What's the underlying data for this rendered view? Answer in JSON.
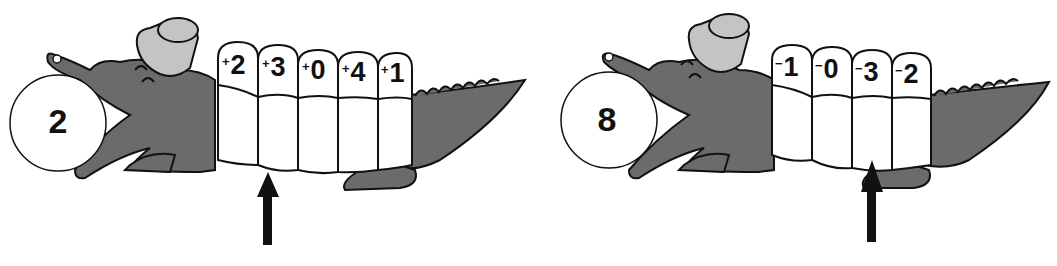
{
  "puzzles": [
    {
      "start": "2",
      "operator": "+",
      "segments": [
        "2",
        "3",
        "0",
        "4",
        "1"
      ],
      "arrow_segment_index": 1
    },
    {
      "start": "8",
      "operator": "−",
      "segments": [
        "1",
        "0",
        "3",
        "2"
      ],
      "arrow_segment_index": 2
    }
  ],
  "colors": {
    "body": "#6b6b6b",
    "hat": "#c4c4c4",
    "outline": "#111111",
    "segment": "#ffffff"
  }
}
